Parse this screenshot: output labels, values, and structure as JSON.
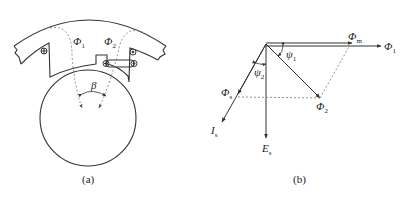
{
  "figure_a": {
    "caption": "(a)",
    "labels": {
      "phi1": {
        "sym": "Φ",
        "sub": "1"
      },
      "phi2": {
        "sym": "Φ",
        "sub": "2"
      },
      "beta": "β"
    }
  },
  "figure_b": {
    "caption": "(b)",
    "labels": {
      "phi_m": {
        "sym": "Φ",
        "sub": "m"
      },
      "phi_1": {
        "sym": "Φ",
        "sub": "1"
      },
      "phi_2": {
        "sym": "Φ",
        "sub": "2"
      },
      "phi_s": {
        "sym": "Φ",
        "sub": "s"
      },
      "psi_1": {
        "sym": "ψ",
        "sub": "1"
      },
      "psi_2": {
        "sym": "ψ",
        "sub": "2"
      },
      "i_s": {
        "sym": "I",
        "sub": "s"
      },
      "e_s": {
        "sym": "E",
        "sub": "s"
      }
    }
  },
  "colors": {
    "line": "#333333",
    "dashed": "#777777",
    "background": "#ffffff"
  }
}
